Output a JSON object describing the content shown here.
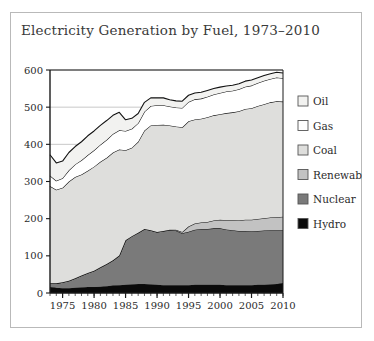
{
  "figure": {
    "title": "Electricity Generation by Fuel, 1973–2010",
    "border_color": "#b9b9b9",
    "background": "#ffffff"
  },
  "chart_data": {
    "type": "area",
    "stacked": true,
    "title": "Electricity Generation by Fuel, 1973–2010",
    "xlabel": "",
    "ylabel": "",
    "xlim": [
      1973,
      2010
    ],
    "ylim": [
      0,
      600
    ],
    "grid": true,
    "grid_axis": "y",
    "legend_position": "right",
    "xticks": [
      1975,
      1980,
      1985,
      1990,
      1995,
      2000,
      2005,
      2010
    ],
    "yticks": [
      0,
      100,
      200,
      300,
      400,
      500,
      600
    ],
    "x": [
      1973,
      1974,
      1975,
      1976,
      1977,
      1978,
      1979,
      1980,
      1981,
      1982,
      1983,
      1984,
      1985,
      1986,
      1987,
      1988,
      1989,
      1990,
      1991,
      1992,
      1993,
      1994,
      1995,
      1996,
      1997,
      1998,
      1999,
      2000,
      2001,
      2002,
      2003,
      2004,
      2005,
      2006,
      2007,
      2008,
      2009,
      2010
    ],
    "series": [
      {
        "name": "Hydro",
        "color": "#0a0a0a",
        "values": [
          16,
          14,
          13,
          13,
          14,
          15,
          16,
          16,
          17,
          18,
          20,
          21,
          22,
          23,
          24,
          24,
          23,
          22,
          21,
          21,
          21,
          21,
          21,
          22,
          22,
          22,
          22,
          22,
          21,
          21,
          21,
          21,
          21,
          22,
          22,
          23,
          24,
          27
        ]
      },
      {
        "name": "Nuclear",
        "color": "#7a7a7a",
        "values": [
          10,
          12,
          16,
          20,
          26,
          32,
          38,
          44,
          52,
          60,
          68,
          80,
          120,
          130,
          138,
          148,
          146,
          142,
          146,
          148,
          147,
          140,
          144,
          148,
          150,
          150,
          152,
          152,
          150,
          148,
          146,
          146,
          145,
          145,
          146,
          146,
          145,
          142
        ]
      },
      {
        "name": "Renewables",
        "color": "#c2c2c2",
        "values": [
          0,
          0,
          0,
          0,
          0,
          0,
          0,
          0,
          0,
          0,
          0,
          0,
          0,
          0,
          0,
          0,
          0,
          0,
          0,
          1,
          2,
          3,
          14,
          17,
          18,
          19,
          21,
          23,
          25,
          27,
          28,
          30,
          31,
          32,
          33,
          34,
          35,
          36
        ]
      },
      {
        "name": "Coal",
        "color": "#dededc",
        "values": [
          262,
          252,
          254,
          267,
          272,
          272,
          275,
          280,
          284,
          286,
          290,
          285,
          242,
          238,
          245,
          265,
          282,
          288,
          286,
          281,
          278,
          282,
          283,
          280,
          279,
          282,
          283,
          284,
          288,
          290,
          294,
          298,
          300,
          304,
          307,
          310,
          312,
          310
        ]
      },
      {
        "name": "Gas",
        "color": "#ffffff",
        "values": [
          28,
          24,
          26,
          30,
          34,
          38,
          42,
          44,
          46,
          48,
          50,
          52,
          52,
          51,
          50,
          51,
          52,
          53,
          52,
          51,
          51,
          52,
          52,
          54,
          54,
          55,
          56,
          57,
          58,
          58,
          59,
          60,
          61,
          62,
          63,
          63,
          64,
          63
        ]
      },
      {
        "name": "Oil",
        "color": "#f2f2f0",
        "values": [
          56,
          48,
          46,
          48,
          48,
          50,
          52,
          52,
          52,
          52,
          50,
          48,
          30,
          28,
          26,
          25,
          22,
          20,
          20,
          18,
          18,
          18,
          18,
          17,
          17,
          17,
          16,
          16,
          15,
          15,
          15,
          15,
          15,
          14,
          14,
          14,
          14,
          14
        ]
      }
    ],
    "totals_top": [
      372,
      350,
      355,
      378,
      394,
      407,
      423,
      436,
      451,
      464,
      478,
      486,
      466,
      470,
      483,
      513,
      525,
      525,
      525,
      520,
      517,
      516,
      532,
      538,
      540,
      545,
      550,
      554,
      557,
      559,
      563,
      570,
      573,
      579,
      585,
      590,
      594,
      592
    ]
  },
  "axes": {
    "yticks": [
      "0",
      "100",
      "200",
      "300",
      "400",
      "500",
      "600"
    ],
    "xticks": [
      "1975",
      "1980",
      "1985",
      "1990",
      "1995",
      "2000",
      "2005",
      "2010"
    ],
    "axis_color": "#1a1a1a",
    "grid_color": "#b0b0b0"
  },
  "legend": {
    "items": [
      {
        "label": "Oil",
        "color": "#f2f2f0"
      },
      {
        "label": "Gas",
        "color": "#ffffff"
      },
      {
        "label": "Coal",
        "color": "#dededc"
      },
      {
        "label": "Renewables",
        "color": "#c2c2c2"
      },
      {
        "label": "Nuclear",
        "color": "#7a7a7a"
      },
      {
        "label": "Hydro",
        "color": "#0a0a0a"
      }
    ]
  }
}
